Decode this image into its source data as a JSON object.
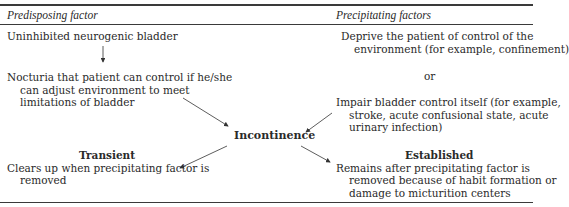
{
  "headers": {
    "predisposing": "Predisposing factor",
    "precipitating": "Precipitating factors"
  },
  "predisposing": {
    "item1": "Uninhibited neurogenic bladder",
    "item2": [
      "Nocturia that patient can control if he/she",
      "can adjust environment to meet",
      "limitations of bladder"
    ]
  },
  "precipitating": {
    "item1": [
      "Deprive the patient of control of the",
      "environment (for example, confinement)"
    ],
    "or": "or",
    "item2": [
      "Impair bladder control itself (for example,",
      "stroke, acute confusional state, acute",
      "urinary infection)"
    ]
  },
  "center": {
    "label": "Incontinence"
  },
  "transient": {
    "title": "Transient",
    "lines": [
      "Clears up when precipitating factor is",
      "removed"
    ]
  },
  "established": {
    "title": "Established",
    "lines": [
      "Remains after precipitating factor is",
      "removed because of habit formation or",
      "damage to micturition centers"
    ]
  }
}
